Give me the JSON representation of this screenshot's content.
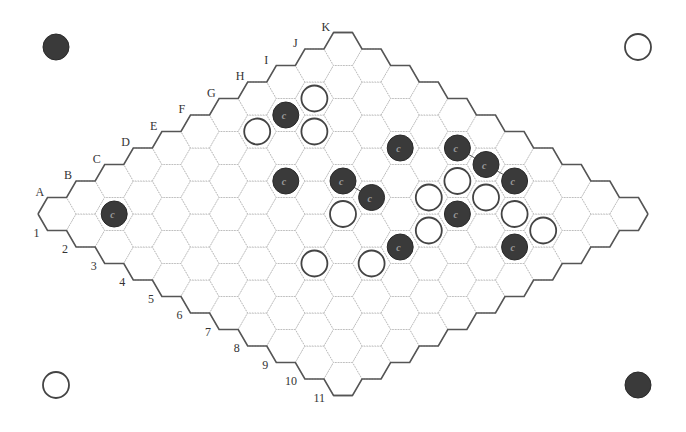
{
  "board": {
    "size": 11,
    "origin": {
      "x": 57,
      "y": 214
    },
    "step": {
      "dx": 28.6,
      "dy": 16.5
    },
    "hex_radius": 19,
    "column_labels": [
      "A",
      "B",
      "C",
      "D",
      "E",
      "F",
      "G",
      "H",
      "I",
      "J",
      "K"
    ],
    "row_labels": [
      "1",
      "2",
      "3",
      "4",
      "5",
      "6",
      "7",
      "8",
      "9",
      "10",
      "11"
    ]
  },
  "corner_markers": [
    {
      "name": "top-left-black-marker",
      "color": "black",
      "x": 56,
      "y": 47
    },
    {
      "name": "top-right-white-marker",
      "color": "white",
      "x": 638,
      "y": 47
    },
    {
      "name": "bottom-left-white-marker",
      "color": "white",
      "x": 56,
      "y": 385
    },
    {
      "name": "bottom-right-black-marker",
      "color": "black",
      "x": 638,
      "y": 385
    }
  ],
  "stones": {
    "black": [
      {
        "cell": "B2",
        "i": 1,
        "j": 1,
        "label": "c"
      },
      {
        "cell": "H2",
        "i": 7,
        "j": 1,
        "label": "c"
      },
      {
        "cell": "F4",
        "i": 5,
        "j": 3,
        "label": "c"
      },
      {
        "cell": "G5",
        "i": 6,
        "j": 4,
        "label": "c"
      },
      {
        "cell": "G6",
        "i": 6,
        "j": 5,
        "label": "c"
      },
      {
        "cell": "I5",
        "i": 8,
        "j": 4,
        "label": "c"
      },
      {
        "cell": "J6",
        "i": 9,
        "j": 5,
        "label": "c"
      },
      {
        "cell": "J7",
        "i": 9,
        "j": 6,
        "label": "c"
      },
      {
        "cell": "J8",
        "i": 9,
        "j": 7,
        "label": "c"
      },
      {
        "cell": "H8",
        "i": 7,
        "j": 7,
        "label": "c"
      },
      {
        "cell": "F8",
        "i": 5,
        "j": 7,
        "label": "c"
      },
      {
        "cell": "H10",
        "i": 7,
        "j": 9,
        "label": "c"
      }
    ],
    "white": [
      {
        "cell": "I2",
        "i": 8,
        "j": 1
      },
      {
        "cell": "G2",
        "i": 6,
        "j": 1
      },
      {
        "cell": "H3",
        "i": 7,
        "j": 2
      },
      {
        "cell": "F6",
        "i": 5,
        "j": 5
      },
      {
        "cell": "H7",
        "i": 7,
        "j": 6
      },
      {
        "cell": "I7",
        "i": 8,
        "j": 6
      },
      {
        "cell": "I8",
        "i": 8,
        "j": 7
      },
      {
        "cell": "I9",
        "i": 8,
        "j": 8
      },
      {
        "cell": "I10",
        "i": 8,
        "j": 9
      },
      {
        "cell": "G8",
        "i": 6,
        "j": 7
      },
      {
        "cell": "D7",
        "i": 3,
        "j": 6
      },
      {
        "cell": "E8",
        "i": 4,
        "j": 7
      }
    ]
  },
  "links": [
    {
      "from": "G5",
      "to": "G6"
    },
    {
      "from": "J6",
      "to": "J7"
    },
    {
      "from": "J7",
      "to": "J8"
    }
  ]
}
